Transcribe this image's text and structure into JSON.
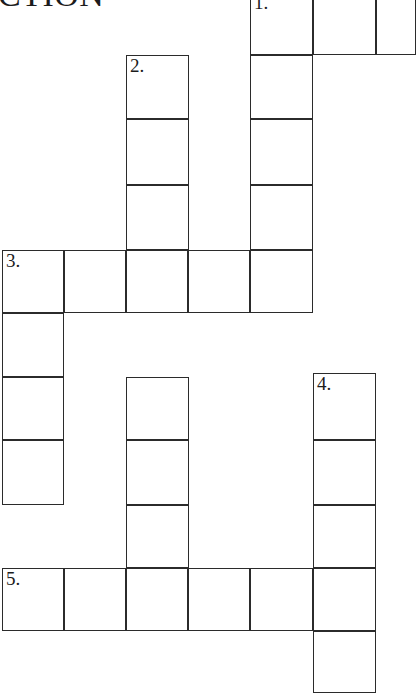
{
  "page": {
    "width": 411,
    "height": 696,
    "background_color": "#ffffff",
    "line_color": "#2b2b2b",
    "text_color": "#1c1c1c",
    "clipped_heading": "CTION"
  },
  "grid": {
    "cell_size": 62,
    "origin_x": 2,
    "column_x": [
      2,
      64,
      126,
      188,
      250,
      313,
      376
    ],
    "row_y": [
      -8,
      55,
      119,
      185,
      250,
      313,
      377,
      440,
      505,
      568,
      631
    ]
  },
  "clues": {
    "numbers": [
      "1.",
      "2.",
      "3.",
      "4.",
      "5."
    ]
  },
  "cells": [
    {
      "name": "cell-1-across-start",
      "x": 250,
      "y": -8,
      "w": 63,
      "h": 63,
      "number": "1.",
      "letter": ""
    },
    {
      "name": "cell-1-across-2",
      "x": 313,
      "y": -8,
      "w": 63,
      "h": 63,
      "number": "",
      "letter": ""
    },
    {
      "name": "cell-1-across-3",
      "x": 376,
      "y": -8,
      "w": 40,
      "h": 63,
      "number": "",
      "letter": ""
    },
    {
      "name": "cell-2-down-start",
      "x": 126,
      "y": 55,
      "w": 63,
      "h": 64,
      "number": "2.",
      "letter": ""
    },
    {
      "name": "cell-1-down-r2",
      "x": 250,
      "y": 55,
      "w": 63,
      "h": 64,
      "number": "",
      "letter": ""
    },
    {
      "name": "cell-2-down-r2",
      "x": 126,
      "y": 119,
      "w": 63,
      "h": 66,
      "number": "",
      "letter": ""
    },
    {
      "name": "cell-1-down-r3",
      "x": 250,
      "y": 119,
      "w": 63,
      "h": 66,
      "number": "",
      "letter": ""
    },
    {
      "name": "cell-2-down-r3",
      "x": 126,
      "y": 185,
      "w": 63,
      "h": 65,
      "number": "",
      "letter": ""
    },
    {
      "name": "cell-1-down-r4",
      "x": 250,
      "y": 185,
      "w": 63,
      "h": 65,
      "number": "",
      "letter": ""
    },
    {
      "name": "cell-3-across-start",
      "x": 2,
      "y": 250,
      "w": 62,
      "h": 63,
      "number": "3.",
      "letter": ""
    },
    {
      "name": "cell-3-across-2",
      "x": 64,
      "y": 250,
      "w": 62,
      "h": 63,
      "number": "",
      "letter": ""
    },
    {
      "name": "cell-3-across-3",
      "x": 126,
      "y": 250,
      "w": 62,
      "h": 63,
      "number": "",
      "letter": ""
    },
    {
      "name": "cell-3-across-4",
      "x": 188,
      "y": 250,
      "w": 62,
      "h": 63,
      "number": "",
      "letter": ""
    },
    {
      "name": "cell-3-across-5",
      "x": 250,
      "y": 250,
      "w": 63,
      "h": 63,
      "number": "",
      "letter": ""
    },
    {
      "name": "cell-3-down-r2",
      "x": 2,
      "y": 313,
      "w": 62,
      "h": 64,
      "number": "",
      "letter": ""
    },
    {
      "name": "cell-3-down-r3",
      "x": 2,
      "y": 377,
      "w": 62,
      "h": 63,
      "number": "",
      "letter": ""
    },
    {
      "name": "cell-2-down-r5",
      "x": 126,
      "y": 377,
      "w": 63,
      "h": 63,
      "number": "",
      "letter": ""
    },
    {
      "name": "cell-4-down-start",
      "x": 313,
      "y": 373,
      "w": 63,
      "h": 67,
      "number": "4.",
      "letter": ""
    },
    {
      "name": "cell-3-down-r4",
      "x": 2,
      "y": 440,
      "w": 62,
      "h": 65,
      "number": "",
      "letter": ""
    },
    {
      "name": "cell-2-down-r6",
      "x": 126,
      "y": 440,
      "w": 63,
      "h": 65,
      "number": "",
      "letter": ""
    },
    {
      "name": "cell-4-down-r2",
      "x": 313,
      "y": 440,
      "w": 63,
      "h": 65,
      "number": "",
      "letter": ""
    },
    {
      "name": "cell-2-down-r7",
      "x": 126,
      "y": 505,
      "w": 63,
      "h": 63,
      "number": "",
      "letter": ""
    },
    {
      "name": "cell-4-down-r3",
      "x": 313,
      "y": 505,
      "w": 63,
      "h": 63,
      "number": "",
      "letter": ""
    },
    {
      "name": "cell-5-across-start",
      "x": 2,
      "y": 568,
      "w": 62,
      "h": 63,
      "number": "5.",
      "letter": ""
    },
    {
      "name": "cell-5-across-2",
      "x": 64,
      "y": 568,
      "w": 62,
      "h": 63,
      "number": "",
      "letter": ""
    },
    {
      "name": "cell-5-across-3",
      "x": 126,
      "y": 568,
      "w": 62,
      "h": 63,
      "number": "",
      "letter": ""
    },
    {
      "name": "cell-5-across-4",
      "x": 188,
      "y": 568,
      "w": 62,
      "h": 63,
      "number": "",
      "letter": ""
    },
    {
      "name": "cell-5-across-5",
      "x": 250,
      "y": 568,
      "w": 63,
      "h": 63,
      "number": "",
      "letter": ""
    },
    {
      "name": "cell-5-across-6",
      "x": 313,
      "y": 568,
      "w": 63,
      "h": 63,
      "number": "",
      "letter": ""
    },
    {
      "name": "cell-4-down-r5",
      "x": 313,
      "y": 631,
      "w": 63,
      "h": 62,
      "number": "",
      "letter": ""
    }
  ]
}
